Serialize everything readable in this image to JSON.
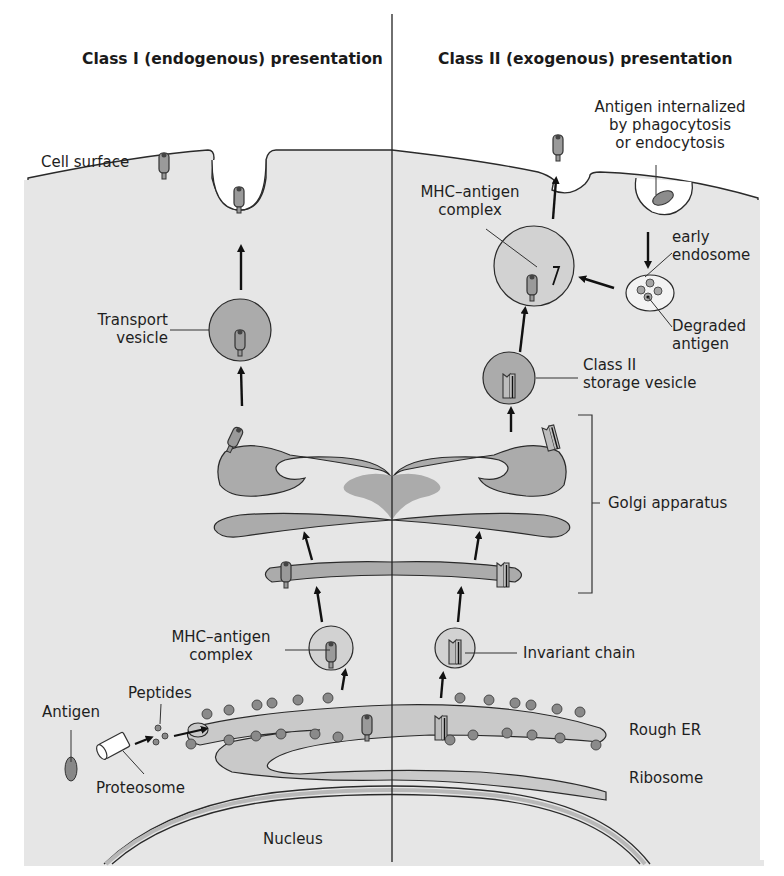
{
  "titles": {
    "left": "Class I (endogenous) presentation",
    "right": "Class II (exogenous) presentation"
  },
  "labels": {
    "cell_surface": "Cell surface",
    "antigen_internalized": [
      "Antigen internalized",
      "by phagocytosis",
      "or endocytosis"
    ],
    "mhc_antigen_complex_right": [
      "MHC–antigen",
      "complex"
    ],
    "early_endosome": [
      "early",
      "endosome"
    ],
    "degraded_antigen": [
      "Degraded",
      "antigen"
    ],
    "transport_vesicle": [
      "Transport",
      "vesicle"
    ],
    "class2_storage_vesicle": [
      "Class II",
      "storage vesicle"
    ],
    "golgi_apparatus": "Golgi apparatus",
    "mhc_antigen_complex_left": [
      "MHC–antigen",
      "complex"
    ],
    "invariant_chain": "Invariant chain",
    "peptides": "Peptides",
    "antigen": "Antigen",
    "proteosome": "Proteosome",
    "rough_er": "Rough ER",
    "ribosome": "Ribosome",
    "nucleus": "Nucleus"
  },
  "colors": {
    "cytoplasm": "#e6e6e6",
    "organelle": "#a9a9a9",
    "vesicle_light": "#d2d2d2",
    "outline": "#2a2a2a",
    "background": "#ffffff"
  }
}
